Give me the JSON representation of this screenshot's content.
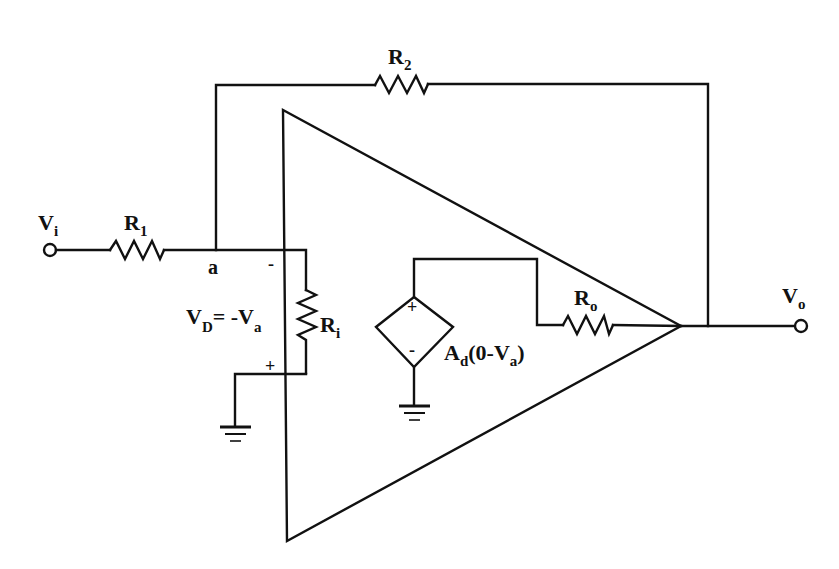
{
  "diagram": {
    "type": "circuit-schematic",
    "colors": {
      "ink": "#111111",
      "background": "#ffffff"
    },
    "labels": {
      "vi": {
        "main": "V",
        "sub": "i"
      },
      "vo": {
        "main": "V",
        "sub": "o"
      },
      "r1": {
        "main": "R",
        "sub": "1"
      },
      "r2": {
        "main": "R",
        "sub": "2"
      },
      "ri": {
        "main": "R",
        "sub": "i"
      },
      "ro": {
        "main": "R",
        "sub": "o"
      },
      "node_a": "a",
      "minus_input": "-",
      "plus_input": "+",
      "vd_expr": {
        "v": "V",
        "d_sub": "D",
        "eq": "= -V",
        "a_sub": "a"
      },
      "source_plus": "+",
      "source_minus": "-",
      "source_expr": {
        "a": "A",
        "d_sub": "d",
        "mid": "(0-V",
        "a_sub": "a",
        "close": ")"
      }
    },
    "components": [
      {
        "id": "vi",
        "kind": "terminal",
        "label": "Vi"
      },
      {
        "id": "r1",
        "kind": "resistor",
        "label": "R1",
        "between": [
          "vi",
          "node_a"
        ]
      },
      {
        "id": "r2",
        "kind": "resistor",
        "label": "R2",
        "between": [
          "node_a",
          "vo"
        ],
        "role": "feedback"
      },
      {
        "id": "ri",
        "kind": "resistor",
        "label": "Ri",
        "role": "input resistance"
      },
      {
        "id": "ro",
        "kind": "resistor",
        "label": "Ro",
        "role": "output resistance"
      },
      {
        "id": "src",
        "kind": "dependent-voltage-source",
        "label": "Ad(0-Va)"
      },
      {
        "id": "gnd1",
        "kind": "ground"
      },
      {
        "id": "gnd2",
        "kind": "ground"
      },
      {
        "id": "opamp",
        "kind": "op-amp-triangle"
      },
      {
        "id": "vo",
        "kind": "terminal",
        "label": "Vo"
      }
    ]
  }
}
